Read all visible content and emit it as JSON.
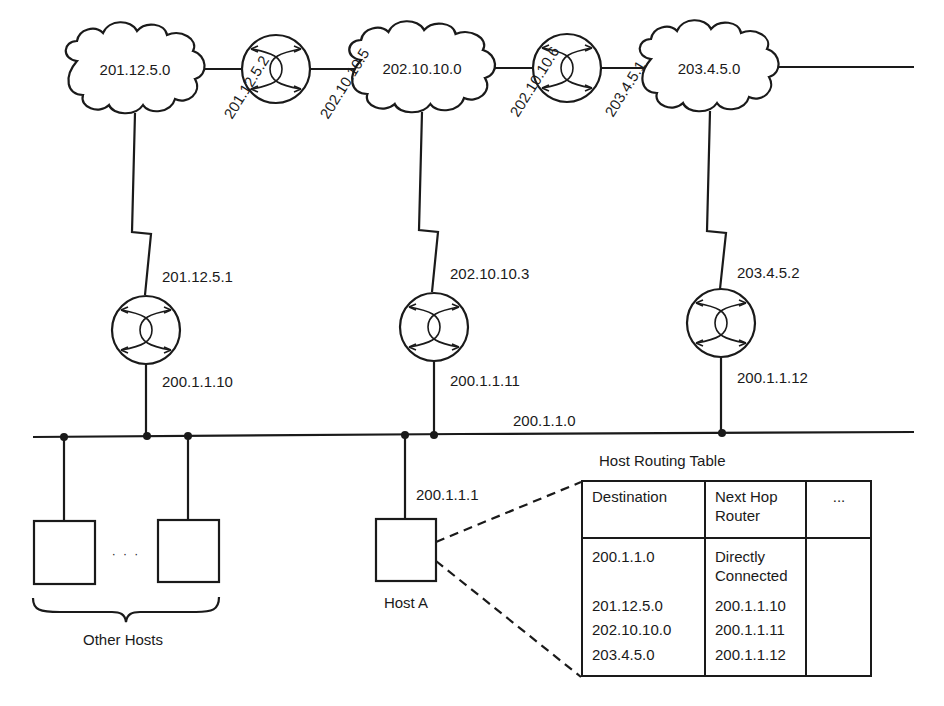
{
  "networks": {
    "net1": "201.12.5.0",
    "net2": "202.10.10.0",
    "net3": "203.4.5.0",
    "lan": "200.1.1.0"
  },
  "router_interfaces": {
    "r_top1_left": "201.12.5.2",
    "r_top1_right": "202.10.10.5",
    "r_top2_left": "202.10.10.6",
    "r_top2_right": "203.4.5.1",
    "r1_wan": "201.12.5.1",
    "r1_lan": "200.1.1.10",
    "r2_wan": "202.10.10.3",
    "r2_lan": "200.1.1.11",
    "r3_wan": "203.4.5.2",
    "r3_lan": "200.1.1.12"
  },
  "hosts": {
    "host_a_label": "Host A",
    "host_a_ip": "200.1.1.1",
    "ellipsis": "· · ·",
    "other_hosts_label": "Other Hosts"
  },
  "routing_table": {
    "title": "Host Routing Table",
    "headers": [
      "Destination",
      "Next Hop Router",
      "..."
    ],
    "header_next_hop_line1": "Next Hop",
    "header_next_hop_line2": "Router",
    "rows": [
      {
        "destination": "200.1.1.0",
        "next_hop_line1": "Directly",
        "next_hop_line2": "Connected",
        "extra": ""
      },
      {
        "destination": "201.12.5.0",
        "next_hop": "200.1.1.10",
        "extra": ""
      },
      {
        "destination": "202.10.10.0",
        "next_hop": "200.1.1.11",
        "extra": ""
      },
      {
        "destination": "203.4.5.0",
        "next_hop": "200.1.1.12",
        "extra": ""
      }
    ]
  },
  "colors": {
    "ink": "#1a1a1a",
    "background": "#ffffff"
  }
}
